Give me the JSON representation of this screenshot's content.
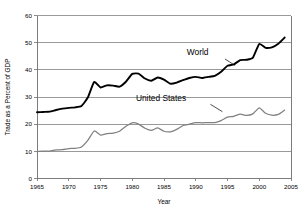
{
  "chart_data": {
    "type": "line",
    "title": "",
    "xlabel": "Year",
    "ylabel": "Trade as a Percent of GDP",
    "xlim": [
      1965,
      2005
    ],
    "ylim": [
      0,
      60
    ],
    "grid": "horizontal",
    "legend_position": "inline-annotations",
    "xticks": [
      1965,
      1970,
      1975,
      1980,
      1985,
      1990,
      1995,
      2000,
      2005
    ],
    "yticks": [
      0,
      10,
      20,
      30,
      40,
      50,
      60
    ],
    "x": [
      1965,
      1966,
      1967,
      1968,
      1969,
      1970,
      1971,
      1972,
      1973,
      1974,
      1975,
      1976,
      1977,
      1978,
      1979,
      1980,
      1981,
      1982,
      1983,
      1984,
      1985,
      1986,
      1987,
      1988,
      1989,
      1990,
      1991,
      1992,
      1993,
      1994,
      1995,
      1996,
      1997,
      1998,
      1999,
      2000,
      2001,
      2002,
      2003,
      2004
    ],
    "series": [
      {
        "name": "World",
        "color": "#000000",
        "values": [
          24.4,
          24.5,
          24.6,
          25.2,
          25.7,
          26.0,
          26.2,
          26.7,
          29.8,
          35.5,
          33.5,
          34.3,
          34.2,
          33.8,
          35.6,
          38.5,
          38.6,
          36.8,
          36.0,
          37.2,
          36.4,
          34.9,
          35.3,
          36.2,
          37.0,
          37.4,
          37.0,
          37.4,
          37.8,
          39.3,
          41.5,
          42.0,
          43.6,
          43.7,
          44.5,
          49.5,
          48.1,
          48.3,
          49.6,
          51.9
        ]
      },
      {
        "name": "United States",
        "color": "#808080",
        "values": [
          9.9,
          10.1,
          10.1,
          10.5,
          10.6,
          11.0,
          11.1,
          11.6,
          14.0,
          17.5,
          16.0,
          16.5,
          16.7,
          17.4,
          19.2,
          20.5,
          20.0,
          18.5,
          17.7,
          18.6,
          17.4,
          17.2,
          18.1,
          19.5,
          20.0,
          20.6,
          20.5,
          20.6,
          20.6,
          21.3,
          22.6,
          22.9,
          23.7,
          23.2,
          23.8,
          26.0,
          24.0,
          23.3,
          23.6,
          25.2
        ]
      }
    ],
    "annotations": [
      {
        "text": "World",
        "x": 1992.0,
        "y": 45.3
      },
      {
        "text": "United States",
        "x": 1988.5,
        "y": 28.4
      }
    ]
  }
}
